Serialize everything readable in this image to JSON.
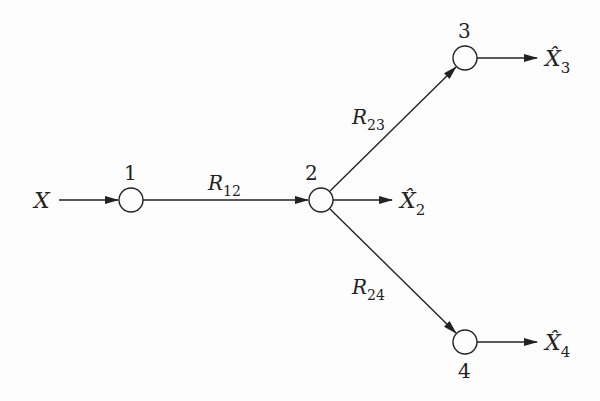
{
  "diagram": {
    "type": "network-flow",
    "source": {
      "label": "X"
    },
    "nodes": [
      {
        "id": "1",
        "label": "1",
        "x": 131,
        "y": 200
      },
      {
        "id": "2",
        "label": "2",
        "x": 321,
        "y": 200
      },
      {
        "id": "3",
        "label": "3",
        "x": 465,
        "y": 58
      },
      {
        "id": "4",
        "label": "4",
        "x": 465,
        "y": 342
      }
    ],
    "edges": [
      {
        "from": "X",
        "to": "1",
        "label": ""
      },
      {
        "from": "1",
        "to": "2",
        "label": "R",
        "subscript": "12"
      },
      {
        "from": "2",
        "to": "3",
        "label": "R",
        "subscript": "23"
      },
      {
        "from": "2",
        "to": "4",
        "label": "R",
        "subscript": "24"
      }
    ],
    "outputs": [
      {
        "node": "2",
        "label": "X̂",
        "subscript": "2"
      },
      {
        "node": "3",
        "label": "X̂",
        "subscript": "3"
      },
      {
        "node": "4",
        "label": "X̂",
        "subscript": "4"
      }
    ],
    "colors": {
      "stroke": "#222222",
      "background": "#fdfdfd"
    }
  }
}
